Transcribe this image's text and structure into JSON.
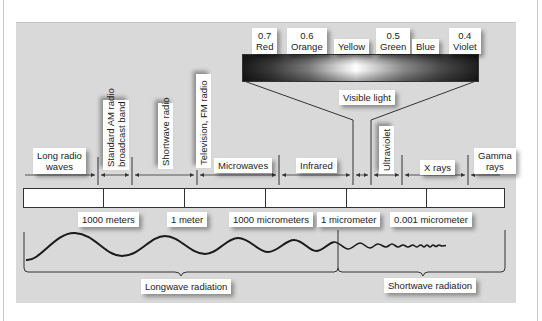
{
  "visible_light": {
    "label": "Visible light",
    "colors": [
      {
        "wavelength": "0.7",
        "name": "Red"
      },
      {
        "wavelength": "0.6",
        "name": "Orange"
      },
      {
        "wavelength": "",
        "name": "Yellow"
      },
      {
        "wavelength": "0.5",
        "name": "Green"
      },
      {
        "wavelength": "",
        "name": "Blue"
      },
      {
        "wavelength": "0.4",
        "name": "Violet"
      }
    ]
  },
  "bands": [
    {
      "name": "Long radio waves",
      "line1": "Long radio",
      "line2": "waves"
    },
    {
      "name": "Standard AM radio broadcast band",
      "line1": "Standard AM radio",
      "line2": "broadcast band"
    },
    {
      "name": "Shortwave radio"
    },
    {
      "name": "Television, FM radio"
    },
    {
      "name": "Microwaves"
    },
    {
      "name": "Infrared"
    },
    {
      "name": "Ultraviolet"
    },
    {
      "name": "X rays"
    },
    {
      "name": "Gamma rays",
      "line1": "Gamma",
      "line2": "rays"
    }
  ],
  "scale": [
    "1000 meters",
    "1 meter",
    "1000 micrometers",
    "1 micrometer",
    "0.001 micrometer"
  ],
  "radiation": {
    "longwave": "Longwave radiation",
    "shortwave": "Shortwave radiation"
  }
}
